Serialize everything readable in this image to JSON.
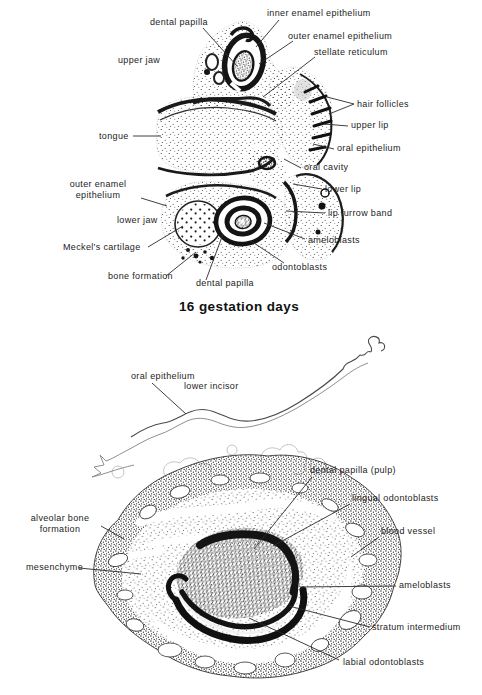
{
  "figure": {
    "background": "#ffffff",
    "ink_color": "#1a1a1a",
    "leader_color": "#2a2a2a"
  },
  "panel1": {
    "caption": "16 gestation days",
    "labels": {
      "inner_enamel_epithelium": "inner enamel epithelium",
      "dental_papilla_upper": "dental papilla",
      "outer_enamel_epithelium_upper": "outer enamel epithelium",
      "stellate_reticulum": "stellate reticulum",
      "upper_jaw": "upper jaw",
      "hair_follicles": "hair follicles",
      "upper_lip": "upper lip",
      "oral_epithelium": "oral epithelium",
      "oral_cavity": "oral cavity",
      "tongue": "tongue",
      "outer_enamel_epithelium_lower": "outer enamel epithelium",
      "lower_lip": "lower lip",
      "lip_furrow_band": "lip furrow band",
      "lower_jaw": "lower jaw",
      "ameloblasts": "ameloblasts",
      "meckels_cartilage": "Meckel's cartilage",
      "odontoblasts": "odontoblasts",
      "bone_formation": "bone formation",
      "dental_papilla_lower": "dental papilla"
    }
  },
  "panel2": {
    "labels": {
      "oral_epithelium": "oral epithelium",
      "lower_incisor": "lower incisor",
      "dental_papilla_pulp": "dental papilla (pulp)",
      "lingual_odontoblasts": "lingual odontoblasts",
      "alveolar_bone_formation": "alveolar bone formation",
      "blood_vessel": "blood vessel",
      "mesenchyme": "mesenchyme",
      "ameloblasts": "ameloblasts",
      "stratum_intermedium": "stratum intermedium",
      "labial_odontoblasts": "labial odontoblasts"
    }
  }
}
